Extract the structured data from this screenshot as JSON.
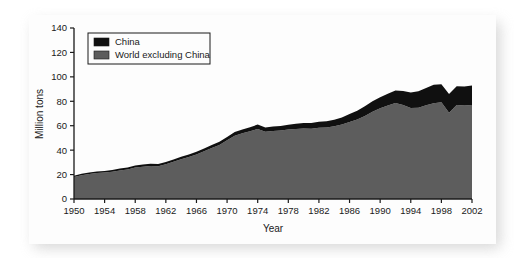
{
  "chart_data": {
    "type": "area",
    "stacked": true,
    "title": "",
    "xlabel": "Year",
    "ylabel": "Million tons",
    "xlim": [
      1950,
      2002
    ],
    "ylim": [
      0,
      140
    ],
    "ytick_step": 20,
    "xtick_step": 4,
    "grid": false,
    "legend_position": "top-left",
    "yticks": [
      0,
      20,
      40,
      60,
      80,
      100,
      120,
      140
    ],
    "xticks": [
      1950,
      1954,
      1958,
      1962,
      1966,
      1970,
      1974,
      1978,
      1982,
      1986,
      1990,
      1994,
      1998,
      2002
    ],
    "legend": [
      {
        "name": "China",
        "color": "#101010"
      },
      {
        "name": "World excluding China",
        "color": "#5d5d5d"
      }
    ],
    "x": [
      1950,
      1951,
      1952,
      1953,
      1954,
      1955,
      1956,
      1957,
      1958,
      1959,
      1960,
      1961,
      1962,
      1963,
      1964,
      1965,
      1966,
      1967,
      1968,
      1969,
      1970,
      1971,
      1972,
      1973,
      1974,
      1975,
      1976,
      1977,
      1978,
      1979,
      1980,
      1981,
      1982,
      1983,
      1984,
      1985,
      1986,
      1987,
      1988,
      1989,
      1990,
      1991,
      1992,
      1993,
      1994,
      1995,
      1996,
      1997,
      1998,
      1999,
      2000,
      2001,
      2002
    ],
    "series": [
      {
        "name": "World excluding China",
        "color": "#5d5d5d",
        "values": [
          18.0,
          19.5,
          20.5,
          21.2,
          21.6,
          22.4,
          23.4,
          24.2,
          25.8,
          26.5,
          27.0,
          26.9,
          28.5,
          30.5,
          32.5,
          34.4,
          36.4,
          39.0,
          41.7,
          44.3,
          48.0,
          51.8,
          53.9,
          55.5,
          57.4,
          55.0,
          55.6,
          56.0,
          56.8,
          57.4,
          57.8,
          57.6,
          58.4,
          58.6,
          59.5,
          61.0,
          63.0,
          65.0,
          68.0,
          71.4,
          74.4,
          76.5,
          78.5,
          77.0,
          74.5,
          74.8,
          76.8,
          78.4,
          79.2,
          70.6,
          77.0,
          76.5,
          77.0
        ]
      },
      {
        "name": "China",
        "color": "#101010",
        "values": [
          1.0,
          1.1,
          1.2,
          1.3,
          1.4,
          1.4,
          1.5,
          1.6,
          1.7,
          1.8,
          1.8,
          1.7,
          1.8,
          1.9,
          2.0,
          2.1,
          2.3,
          2.4,
          2.5,
          2.6,
          2.8,
          3.0,
          3.1,
          3.3,
          3.5,
          3.6,
          3.7,
          3.8,
          4.0,
          4.2,
          4.4,
          4.6,
          4.8,
          5.1,
          5.4,
          5.8,
          6.5,
          7.2,
          8.0,
          8.6,
          9.0,
          9.6,
          10.4,
          11.5,
          12.6,
          13.4,
          14.0,
          15.1,
          14.8,
          15.3,
          15.4,
          15.6,
          16.0
        ]
      }
    ],
    "totals_note": "Values are stacked: top of black band = world total"
  },
  "legend": {
    "items": [
      {
        "label": "China"
      },
      {
        "label": "World excluding China"
      }
    ]
  },
  "axes": {
    "y_title": "Million tons",
    "x_title": "Year",
    "y_tick_labels": [
      "0",
      "20",
      "40",
      "60",
      "80",
      "100",
      "120",
      "140"
    ],
    "x_tick_labels": [
      "1950",
      "1954",
      "1958",
      "1962",
      "1966",
      "1970",
      "1974",
      "1978",
      "1982",
      "1986",
      "1990",
      "1994",
      "1998",
      "2002"
    ]
  },
  "colors": {
    "china": "#101010",
    "world_excluding_china": "#5d5d5d",
    "axis": "#1a1a1a",
    "card_background": "#fdfdfd",
    "page_background": "#ffffff"
  }
}
